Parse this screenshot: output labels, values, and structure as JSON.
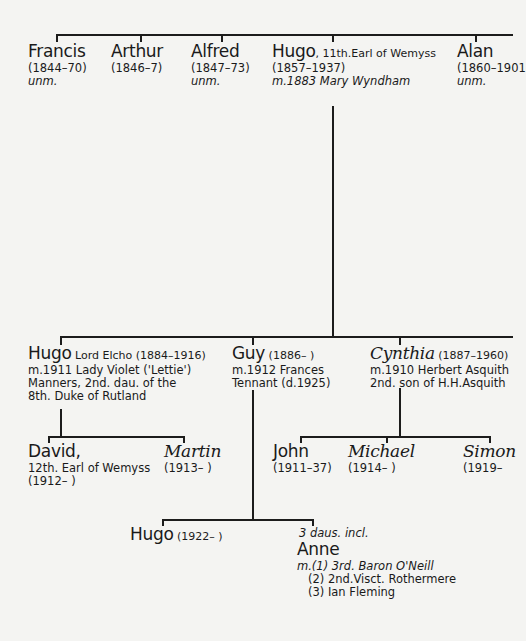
{
  "generation1": [
    {
      "id": "francis",
      "name": "Francis",
      "dates": "(1844–70)",
      "note": "unm."
    },
    {
      "id": "arthur",
      "name": "Arthur",
      "dates": "(1846–7)",
      "note": ""
    },
    {
      "id": "alfred",
      "name": "Alfred",
      "dates": "(1847–73)",
      "note": "unm."
    },
    {
      "id": "hugo11",
      "name": "Hugo",
      "title": ", 11th.Earl of Wemyss",
      "dates": "(1857–1937)",
      "note": "m.1883 Mary Wyndham"
    },
    {
      "id": "alan",
      "name": "Alan",
      "dates": "(1860–1901",
      "note": "unm."
    }
  ],
  "generation2": [
    {
      "id": "hugo-elcho",
      "name": "Hugo",
      "title": " Lord Elcho (1884–1916)",
      "lines": [
        "m.1911 Lady Violet ('Lettie')",
        "Manners, 2nd. dau. of the",
        "8th. Duke of Rutland"
      ]
    },
    {
      "id": "guy",
      "name": "Guy",
      "title": " (1886–      )",
      "lines": [
        "m.1912 Frances",
        "Tennant (d.1925)"
      ]
    },
    {
      "id": "cynthia",
      "name": "Cynthia",
      "title": " (1887–1960)",
      "lines": [
        "m.1910 Herbert Asquith",
        "2nd. son of H.H.Asquith"
      ]
    }
  ],
  "generation3": [
    {
      "id": "david",
      "name": "David,",
      "lines": [
        "12th. Earl of Wemyss",
        "(1912–      )"
      ]
    },
    {
      "id": "martin",
      "name": "Martin",
      "lines": [
        "(1913–      )"
      ]
    },
    {
      "id": "john",
      "name": "John",
      "lines": [
        "(1911–37)"
      ]
    },
    {
      "id": "michael",
      "name": "Michael",
      "lines": [
        "(1914–       )"
      ]
    },
    {
      "id": "simon",
      "name": "Simon",
      "lines": [
        "(1919–"
      ]
    }
  ],
  "generation4": [
    {
      "id": "hugo1922",
      "name": "Hugo",
      "title": " (1922–          )"
    },
    {
      "id": "anne",
      "prefix": "3 daus. incl.",
      "name": "Anne",
      "lines": [
        "m.(1) 3rd. Baron O'Neill",
        "   (2) 2nd.Visct. Rothermere",
        "   (3) Ian Fleming"
      ]
    }
  ]
}
